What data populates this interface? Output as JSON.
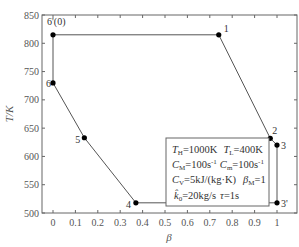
{
  "chart_data": {
    "type": "line",
    "title": "",
    "xlabel": "β",
    "ylabel": "T/K",
    "xlim": [
      -0.03,
      1.05
    ],
    "ylim": [
      500,
      850
    ],
    "x_ticks": [
      0,
      0.1,
      0.2,
      0.3,
      0.4,
      0.5,
      0.6,
      0.7,
      0.8,
      0.9,
      1
    ],
    "x_tick_labels": [
      "0",
      "0.1",
      "0.2",
      "0.3",
      "0.4",
      "0.5",
      "0.6",
      "0.7",
      "0.8",
      "0.9",
      "1"
    ],
    "y_ticks": [
      500,
      550,
      600,
      650,
      700,
      750,
      800,
      850
    ],
    "y_tick_labels": [
      "500",
      "550",
      "600",
      "650",
      "700",
      "750",
      "800",
      "850"
    ],
    "grid": false,
    "series": [
      {
        "name": "cycle",
        "closed": true,
        "points": [
          {
            "label": "6'(0)",
            "x": 0.0,
            "y": 815
          },
          {
            "label": "1",
            "x": 0.74,
            "y": 815
          },
          {
            "label": "2",
            "x": 0.97,
            "y": 632
          },
          {
            "label": "3",
            "x": 1.0,
            "y": 620
          },
          {
            "label": "3'",
            "x": 1.0,
            "y": 518
          },
          {
            "label": "4",
            "x": 0.37,
            "y": 518
          },
          {
            "label": "5",
            "x": 0.14,
            "y": 633
          },
          {
            "label": "6",
            "x": 0.0,
            "y": 730
          }
        ]
      }
    ],
    "annotation_box": {
      "lines": [
        "T_H=1000K   T_L=400K",
        "C_M=100s⁻¹  C_m=100s⁻¹",
        "C_V=5kJ/(kg·K)   β_M=1",
        "k̂₀=20kg/s  τ=1s"
      ]
    }
  },
  "legend": {
    "line1a_sym": "T",
    "line1a_sub": "H",
    "line1a_val": "=1000K",
    "line1b_sym": "T",
    "line1b_sub": "L",
    "line1b_val": "=400K",
    "line2a_sym": "C",
    "line2a_sub": "M",
    "line2a_val": "=100s",
    "line2a_sup": "-1",
    "line2b_sym": "C",
    "line2b_sub": "m",
    "line2b_val": "=100s",
    "line2b_sup": "-1",
    "line3a_sym": "C",
    "line3a_sub": "V",
    "line3a_val": "=5kJ/(kg·K)",
    "line3b_sym": "β",
    "line3b_sub": "M",
    "line3b_val": "=1",
    "line4a_sym": "k̂",
    "line4a_sub": "0",
    "line4a_val": "=20kg/s",
    "line4b_sym": "τ",
    "line4b_val": "=1s"
  },
  "colors": {
    "line": "#555555",
    "marker": "#000000",
    "axis": "#666666"
  }
}
